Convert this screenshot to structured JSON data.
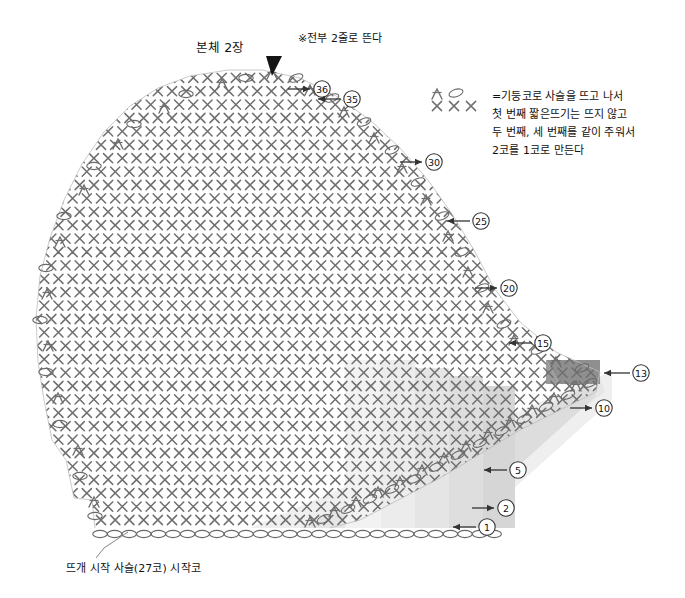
{
  "page": {
    "width": 685,
    "height": 598,
    "background": "#ffffff",
    "type": "crochet-pattern-chart",
    "language": "ko"
  },
  "title": "본체  2장",
  "note": "※전부 2줄로 뜬다",
  "legend": {
    "symbols": [
      "decrease-symbol",
      "chain-oval",
      "single-crochet-x",
      "single-crochet-x",
      "single-crochet-x"
    ],
    "lines": [
      "=기둥코로 사슬을 뜨고 나서",
      "첫 번째 짧은뜨기는 뜨지 않고",
      "두 번째, 세 번째를 같이 주워서",
      "2코를 1코로 만든다"
    ]
  },
  "start_caption": "뜨개 시작 사슬(27코) 시작코",
  "row_markers": [
    {
      "label": "㊱",
      "text": "36",
      "x": 322,
      "y": 89,
      "arrow": "right",
      "arrow_x1": 288,
      "arrow_x2": 310,
      "arrow_y": 89
    },
    {
      "label": "㉟",
      "text": "35",
      "x": 352,
      "y": 99,
      "arrow": "left",
      "arrow_x1": 341,
      "arrow_x2": 318,
      "arrow_y": 99
    },
    {
      "label": "㉚",
      "text": "30",
      "x": 434,
      "y": 162,
      "arrow": "right",
      "arrow_x1": 400,
      "arrow_x2": 422,
      "arrow_y": 162
    },
    {
      "label": "㉕",
      "text": "25",
      "x": 481,
      "y": 221,
      "arrow": "left",
      "arrow_x1": 470,
      "arrow_x2": 447,
      "arrow_y": 221
    },
    {
      "label": "⑳",
      "text": "20",
      "x": 509,
      "y": 288,
      "arrow": "right",
      "arrow_x1": 475,
      "arrow_x2": 497,
      "arrow_y": 288
    },
    {
      "label": "⑮",
      "text": "15",
      "x": 543,
      "y": 343,
      "arrow": "left",
      "arrow_x1": 532,
      "arrow_x2": 509,
      "arrow_y": 343
    },
    {
      "label": "⑬",
      "text": "13",
      "x": 641,
      "y": 373,
      "arrow": "left",
      "arrow_x1": 630,
      "arrow_x2": 604,
      "arrow_y": 373
    },
    {
      "label": "⑩",
      "text": "10",
      "x": 604,
      "y": 408,
      "arrow": "right",
      "arrow_x1": 570,
      "arrow_x2": 592,
      "arrow_y": 408
    },
    {
      "label": "⑤",
      "text": "5",
      "x": 518,
      "y": 470,
      "arrow": "left",
      "arrow_x1": 507,
      "arrow_x2": 484,
      "arrow_y": 470
    },
    {
      "label": "②",
      "text": "2",
      "x": 506,
      "y": 508,
      "arrow": "right",
      "arrow_x1": 472,
      "arrow_x2": 494,
      "arrow_y": 508
    },
    {
      "label": "①",
      "text": "1",
      "x": 487,
      "y": 527,
      "arrow": "left",
      "arrow_x1": 476,
      "arrow_x2": 453,
      "arrow_y": 527
    }
  ],
  "top_marker": {
    "name": "direction-triangle",
    "x": 272,
    "y": 62
  },
  "colors": {
    "stitch": "#6b6b6b",
    "outline": "#555555",
    "shade_light": "#ededed",
    "shade_mid": "#dedede",
    "shade_dark": "#c9c9c9",
    "shade_darkest": "#8f8f8f",
    "text": "#111111"
  },
  "chart_data": {
    "type": "table",
    "title": "본체  2장",
    "foundation_chain_stitches": 27,
    "total_rows": 36,
    "marked_rows": [
      1,
      2,
      5,
      10,
      13,
      15,
      20,
      25,
      30,
      35,
      36
    ],
    "notes": [
      "※전부 2줄로 뜬다",
      "뜨개 시작 사슬(27코) 시작코"
    ]
  }
}
